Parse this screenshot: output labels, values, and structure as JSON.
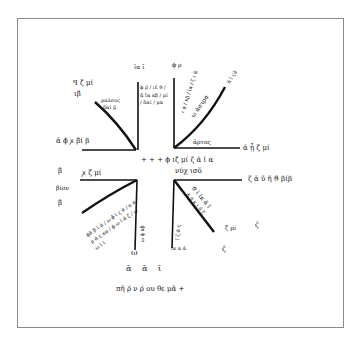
{
  "diagram": {
    "type": "manuscript-wind-diagram",
    "ink_color": "#111111",
    "frame_color": "#8a8a8a",
    "labels": {
      "ul_top": "ꟼ ζ̄ μί",
      "ul_top_sub": "ιβ̄",
      "ul_diag": "μαλσος",
      "ul_diag2": "δαί μ̄",
      "ul_left": "ᾱ ϕ̄ ꭗ β̄ί β",
      "top_left_vert": "ῑα ῑ",
      "top_left_vert_notes": "ϕ ρ̄ / ιε̄ ϑ / ᾱ ῑα κβ / μί / δαί / μα",
      "top_right_vert": "ϕ ρ",
      "top_right_vert_notes": "ι α̣ / κβ / ῑα / ζ ι ᾱ",
      "ur_diag": "ω ἀστρα",
      "ur_diag2": "ᾱ ῑ ϛᾱ",
      "ur_horiz_label": "ἀρτος",
      "ur_right": "ᾱ ᾗ ζ̄ μί",
      "center_line1": "+ + + ϕ ιζ̄ μί ζ ᾱ ῑ α",
      "center_line2": "νύχ ισō",
      "ll_left_a": "β̄",
      "ll_left_b": "βίον",
      "ll_left_c": "β̄",
      "ll_horiz": "ꭗ ζ̄ μί",
      "ll_diag_notes": "ϕᾶ β ῑ ᾱ / ω ϕ̄ ῑ ς ᾱ / κ α ρ ᾱ ς κα / ϕ ω ῑ ᾱ ζ / ω ω ῑ ῑ",
      "ll_vert_notes": "ω ϕ κβ",
      "ll_bottom": "ω",
      "lr_right": "ζ ᾱ ῦ ῆ ϑ βίβ",
      "lr_diag_notes": "ϑ ῑ ῑκ ᾱ ῖ",
      "lr_diag2": "κ α κ ι ᾱ ζ",
      "lr_far": "ζ̄ μί",
      "lr_far2": "ϛ̄",
      "lr_vert_notes": "ῑ ζ ᾱ ϛ",
      "lr_vert_bottom": "ῑκ α ά",
      "lr_diag_bottom": "ϛ̄",
      "bottom_numerals": "ᾱ  ᾱ  ῑ",
      "bottom_caption": "πῆ ρ̂ ν ρ́ ου θε μᾶ +"
    }
  }
}
